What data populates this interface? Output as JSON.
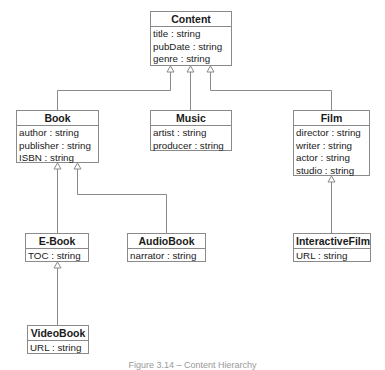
{
  "diagram": {
    "type": "uml-class-inheritance",
    "classes": {
      "content": {
        "name": "Content",
        "attributes": [
          "title : string",
          "pubDate : string",
          "genre : string"
        ]
      },
      "book": {
        "name": "Book",
        "attributes": [
          "author : string",
          "publisher : string",
          "ISBN : string"
        ]
      },
      "music": {
        "name": "Music",
        "attributes": [
          "artist : string",
          "producer : string"
        ]
      },
      "film": {
        "name": "Film",
        "attributes": [
          "director : string",
          "writer : string",
          "actor : string",
          "studio : string"
        ]
      },
      "ebook": {
        "name": "E-Book",
        "attributes": [
          "TOC : string"
        ]
      },
      "audiobook": {
        "name": "AudioBook",
        "attributes": [
          "narrator : string"
        ]
      },
      "interactivefilm": {
        "name": "InteractiveFilm",
        "attributes": [
          "URL : string"
        ]
      },
      "videobook": {
        "name": "VideoBook",
        "attributes": [
          "URL : string"
        ]
      }
    },
    "relationships": [
      {
        "child": "Book",
        "parent": "Content",
        "kind": "generalization"
      },
      {
        "child": "Music",
        "parent": "Content",
        "kind": "generalization"
      },
      {
        "child": "Film",
        "parent": "Content",
        "kind": "generalization"
      },
      {
        "child": "E-Book",
        "parent": "Book",
        "kind": "generalization"
      },
      {
        "child": "AudioBook",
        "parent": "Book",
        "kind": "generalization"
      },
      {
        "child": "InteractiveFilm",
        "parent": "Film",
        "kind": "generalization"
      },
      {
        "child": "VideoBook",
        "parent": "E-Book",
        "kind": "generalization"
      }
    ],
    "colors": {
      "border": "#8a8a8a",
      "line": "#8a8a8a",
      "text": "#1a1a1a"
    }
  },
  "caption": "Figure 3.14 – Content Hierarchy"
}
